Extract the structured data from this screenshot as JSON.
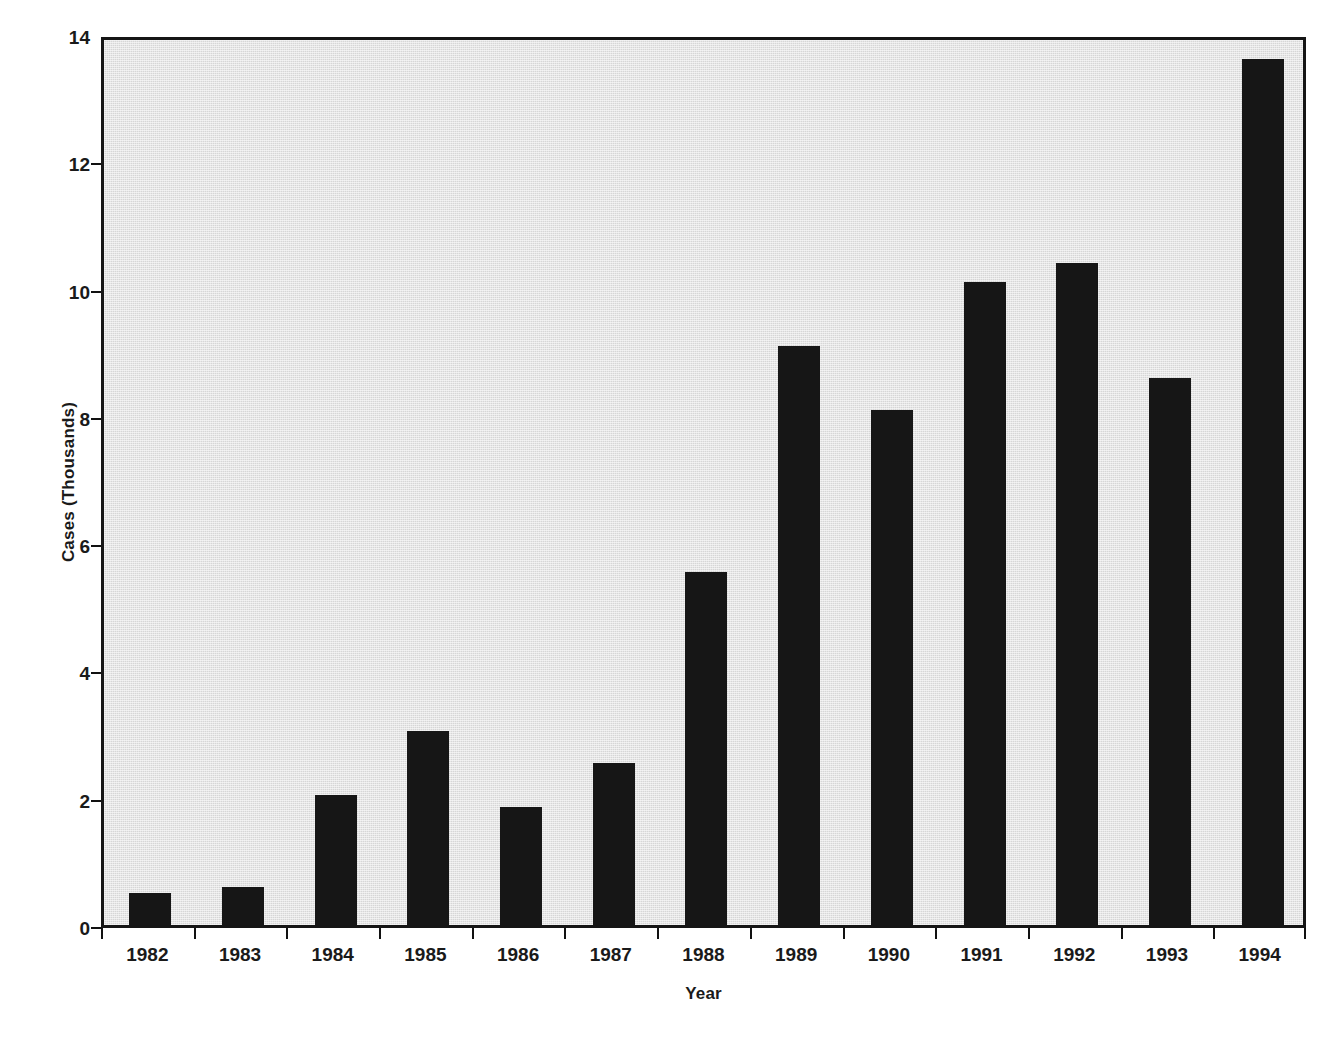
{
  "chart_data": {
    "type": "bar",
    "title": "",
    "xlabel": "Year",
    "ylabel": "Cases (Thousands)",
    "categories": [
      "1982",
      "1983",
      "1984",
      "1985",
      "1986",
      "1987",
      "1988",
      "1989",
      "1990",
      "1991",
      "1992",
      "1993",
      "1994"
    ],
    "values": [
      0.5,
      0.6,
      2.05,
      3.05,
      1.85,
      2.55,
      5.55,
      9.1,
      8.1,
      10.1,
      10.4,
      8.6,
      13.6
    ],
    "ylim": [
      0,
      14
    ],
    "ytick_values": [
      0,
      2,
      4,
      6,
      8,
      10,
      12,
      14
    ],
    "ytick_labels": [
      "0",
      "2",
      "4",
      "6",
      "8",
      "10",
      "12",
      "14"
    ],
    "grid": false,
    "legend": false,
    "legend_position": "none",
    "bar_color": "#161616",
    "plot_background_color": "#d6d6d6",
    "figure_background_color": "#ffffff",
    "axis_color": "#151515"
  }
}
